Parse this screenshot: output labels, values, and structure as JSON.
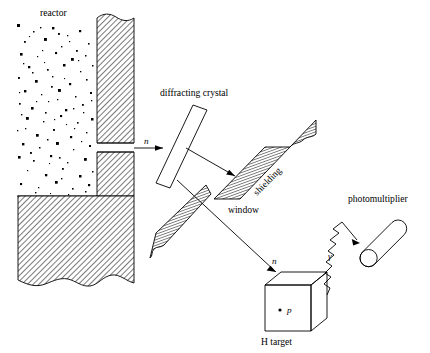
{
  "figure": {
    "domain": "Diagram",
    "background_color": "#ffffff",
    "line_color": "#000000",
    "width": 430,
    "height": 353
  },
  "labels": {
    "reactor": "reactor",
    "diffracting_crystal": "diffracting crystal",
    "shielding": "shielding",
    "window": "window",
    "photomultiplier": "photomultiplier",
    "h_target": "H target",
    "neutron_beam": "n",
    "neutron_diffracted": "n",
    "proton": "p",
    "gamma": "γ"
  },
  "components": [
    {
      "name": "reactor-core",
      "label": "reactor",
      "description": "speckled region representing the reactor core fuel",
      "fill": "#ffffff",
      "pattern": "random-dots"
    },
    {
      "name": "reactor-wall",
      "description": "hatched concrete wall with wavy broken top edge and collimator slot",
      "pattern": "diagonal-hatch"
    },
    {
      "name": "reactor-base",
      "description": "large hatched concrete base with wavy broken bottom edge",
      "pattern": "diagonal-hatch"
    },
    {
      "name": "diffracting-crystal",
      "label": "diffracting crystal",
      "description": "thin tilted unfilled rectangle that diffracts the neutron beam",
      "fill": "#ffffff"
    },
    {
      "name": "shielding-upper",
      "label": "shielding",
      "description": "diagonal hatched bar with wavy broken upper-right end",
      "pattern": "cross-hatch"
    },
    {
      "name": "shielding-lower",
      "description": "diagonal hatched bar with wavy broken lower-left end",
      "pattern": "cross-hatch"
    },
    {
      "name": "window",
      "label": "window",
      "description": "gap between the two shielding bars through which the diffracted neutron passes"
    },
    {
      "name": "h-target",
      "label": "H target",
      "description": "hydrogen target drawn as an isometric cube containing a proton",
      "fill": "#ffffff"
    },
    {
      "name": "photomultiplier",
      "label": "photomultiplier",
      "description": "tilted cylinder (capsule) detector with circular entrance face",
      "fill": "#ffffff"
    }
  ],
  "arrows": [
    {
      "name": "incident-neutron-arrow",
      "label": "n",
      "from": "reactor collimator slot",
      "to": "diffracting crystal",
      "style": "straight-solid"
    },
    {
      "name": "diffracted-beam-arrow",
      "label": "",
      "from": "diffracting crystal",
      "to": "upper shielding",
      "style": "straight-solid"
    },
    {
      "name": "diffracted-neutron-arrow",
      "label": "n",
      "from": "diffracting crystal through window",
      "to": "H target",
      "style": "straight-solid"
    },
    {
      "name": "gamma-ray-arrow",
      "label": "γ",
      "from": "H target",
      "to": "photomultiplier",
      "style": "zigzag-wave"
    }
  ]
}
